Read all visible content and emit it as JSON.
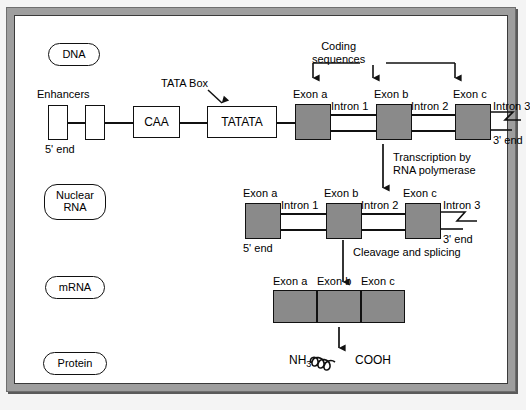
{
  "diagram": {
    "colors": {
      "exon_fill": "#8a8a8a",
      "stroke": "#111111",
      "panel_bg": "#ffffff",
      "frame_gray": "#9e9e9e"
    }
  },
  "stages": {
    "dna": "DNA",
    "nuclear_rna_line1": "Nuclear",
    "nuclear_rna_line2": "RNA",
    "mrna": "mRNA",
    "protein": "Protein"
  },
  "dna_row": {
    "enhancers_label": "Enhancers",
    "five_prime": "5' end",
    "three_prime": "3' end",
    "caa_box": "CAA",
    "tata_box": "TATATA",
    "tata_callout": "TATA Box",
    "coding_label_line1": "Coding",
    "coding_label_line2": "sequences",
    "exons": [
      "Exon a",
      "Exon b",
      "Exon c"
    ],
    "introns": [
      "Intron 1",
      "Intron 2",
      "Intron 3"
    ]
  },
  "arrow_transcription": {
    "line1": "Transcription by",
    "line2": "RNA polymerase"
  },
  "nuclear_rna_row": {
    "five_prime": "5' end",
    "three_prime": "3' end",
    "exons": [
      "Exon a",
      "Exon b",
      "Exon c"
    ],
    "introns": [
      "Intron 1",
      "Intron 2",
      "Intron 3"
    ]
  },
  "arrow_splicing": {
    "line1": "Cleavage and splicing"
  },
  "mrna_row": {
    "exons": [
      "Exon a",
      "Exon b",
      "Exon c"
    ]
  },
  "protein_row": {
    "n_terminus": "NH",
    "n_subscript": "3",
    "c_terminus": "COOH"
  }
}
